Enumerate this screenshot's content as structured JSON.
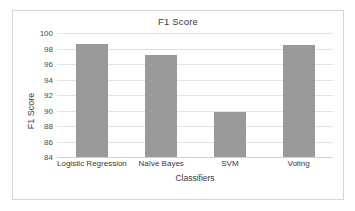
{
  "chart_data": {
    "type": "bar",
    "title": "F1 Score",
    "xlabel": "Classifiers",
    "ylabel": "F1 Score",
    "categories": [
      "Logistic Regression",
      "Naïve Bayes",
      "SVM",
      "Voting"
    ],
    "values": [
      98.6,
      97.1,
      89.8,
      98.5
    ],
    "ylim": [
      84,
      100
    ],
    "yticks": [
      84,
      86,
      88,
      90,
      92,
      94,
      96,
      98,
      100
    ],
    "grid": true,
    "legend": null,
    "bar_color": "#9a9a9a",
    "gridline_color": "#e2e2e2",
    "frame_color": "#d6d6d6",
    "background": "#ffffff"
  }
}
